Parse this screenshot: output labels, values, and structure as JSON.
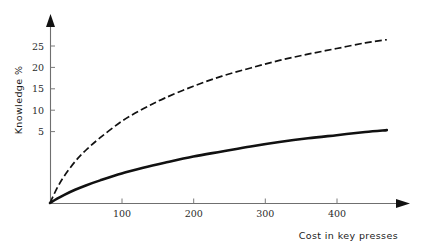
{
  "chart_data": {
    "type": "line",
    "title": "",
    "subtitle": "",
    "xlabel": "Cost in key presses",
    "ylabel": "Knowledge %",
    "xlim": [
      0,
      480
    ],
    "ylim": [
      0,
      28
    ],
    "grid": false,
    "legend": "none",
    "xticks": [
      100,
      200,
      300,
      400
    ],
    "yticks": [
      5,
      10,
      15,
      20,
      25
    ],
    "xtick_labels": [
      "100",
      "200",
      "300",
      "400"
    ],
    "ytick_labels": [
      "5",
      "10",
      "15",
      "20",
      "25"
    ],
    "series": [
      {
        "name": "upper-dashed-curve",
        "style": "dashed",
        "color": "#111111",
        "x": [
          0,
          10,
          20,
          35,
          50,
          70,
          100,
          130,
          160,
          200,
          240,
          280,
          320,
          360,
          400,
          440,
          470
        ],
        "values": [
          0,
          2.4,
          4.3,
          6.6,
          8.4,
          10.4,
          13.0,
          15.0,
          16.7,
          18.6,
          20.2,
          21.5,
          22.7,
          23.7,
          24.6,
          25.5,
          26.0
        ]
      },
      {
        "name": "lower-solid-curve",
        "style": "solid",
        "color": "#111111",
        "x": [
          0,
          10,
          20,
          35,
          50,
          70,
          100,
          130,
          160,
          200,
          240,
          280,
          320,
          360,
          400,
          440,
          470
        ],
        "values": [
          0,
          0.7,
          1.3,
          2.1,
          2.8,
          3.6,
          4.7,
          5.6,
          6.4,
          7.4,
          8.2,
          9.0,
          9.7,
          10.3,
          10.8,
          11.3,
          11.6
        ]
      }
    ]
  },
  "axes": {
    "y_axis_title": "Knowledge %",
    "x_axis_title": "Cost in key presses"
  },
  "colors": {
    "curve": "#111111",
    "axis": "#6f6f6f",
    "text": "#1a1a1a",
    "background": "#ffffff"
  }
}
